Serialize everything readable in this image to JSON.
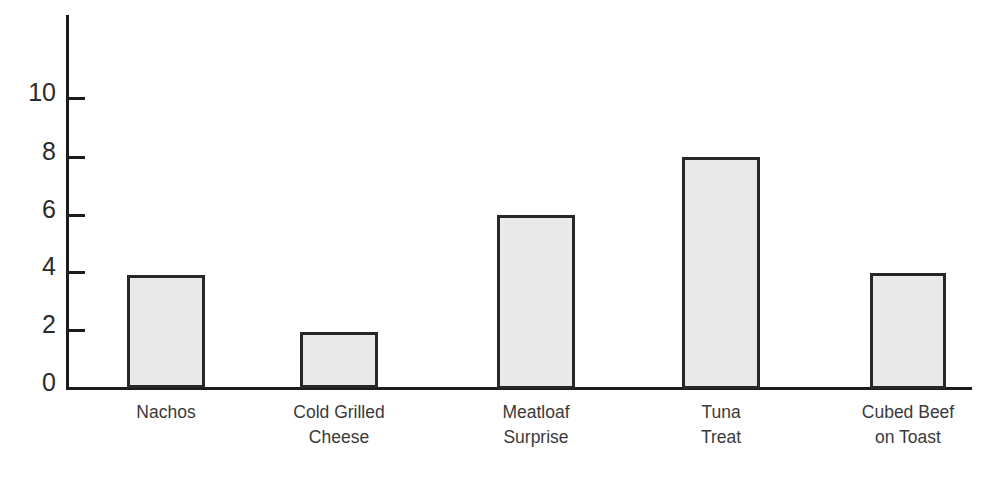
{
  "chart_data": {
    "type": "bar",
    "title": "",
    "xlabel": "",
    "ylabel": "",
    "categories": [
      "Nachos",
      "Cold Grilled Cheese",
      "Meatloaf Surprise",
      "Tuna Treat",
      "Cubed Beef on Toast"
    ],
    "category_lines": [
      [
        "Nachos",
        ""
      ],
      [
        "Cold Grilled",
        "Cheese"
      ],
      [
        "Meatloaf",
        "Surprise"
      ],
      [
        "Tuna",
        "Treat"
      ],
      [
        "Cubed Beef",
        "on Toast"
      ]
    ],
    "values": [
      3.9,
      1.95,
      6,
      8,
      4
    ],
    "ylim": [
      0,
      11.8
    ],
    "yticks": [
      0,
      2,
      4,
      6,
      8,
      10
    ],
    "ytick_labels": [
      "0",
      "2",
      "4",
      "6",
      "8",
      "10"
    ],
    "grid": false,
    "legend": false,
    "colors": {
      "bar_fill": "#e9e9e9",
      "bar_edge": "#272727",
      "axis": "#1c1c1c",
      "tick_text": "#2b2b2b",
      "category_text": "#3a3a3a",
      "background": "#ffffff"
    }
  }
}
